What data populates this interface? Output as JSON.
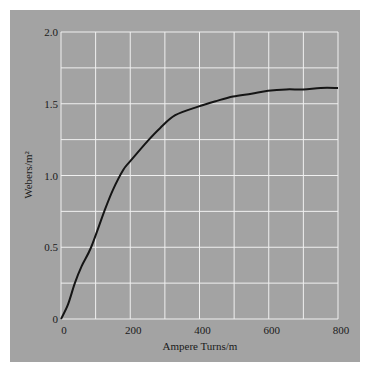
{
  "chart_data": {
    "type": "line",
    "title": "",
    "xlabel": "Ampere Turns/m",
    "ylabel": "Webers/m²",
    "xlim": [
      0,
      800
    ],
    "ylim": [
      0,
      2.0
    ],
    "grid": true,
    "x_ticks": [
      "0",
      "200",
      "400",
      "600",
      "800"
    ],
    "y_ticks": [
      "0",
      "0.5",
      "1.0",
      "1.5",
      "2.0"
    ],
    "x_gridlines": [
      0,
      100,
      200,
      300,
      400,
      500,
      600,
      700,
      800
    ],
    "y_gridlines": [
      0,
      0.25,
      0.5,
      0.75,
      1.0,
      1.25,
      1.5,
      1.75,
      2.0
    ],
    "series": [
      {
        "name": "B-H magnetization curve",
        "x": [
          0,
          20,
          40,
          60,
          87,
          125,
          150,
          180,
          200,
          250,
          286,
          330,
          396,
          450,
          497,
          550,
          598,
          650,
          700,
          750,
          800
        ],
        "y": [
          0,
          0.1,
          0.25,
          0.37,
          0.5,
          0.75,
          0.9,
          1.04,
          1.1,
          1.24,
          1.33,
          1.42,
          1.48,
          1.52,
          1.55,
          1.57,
          1.59,
          1.6,
          1.6,
          1.61,
          1.61
        ]
      }
    ]
  },
  "colors": {
    "background": "#ffffff",
    "panel": "#a3a3a3",
    "grid": "#f0f0f0",
    "curve": "#151515",
    "text": "#1a1a1a"
  }
}
